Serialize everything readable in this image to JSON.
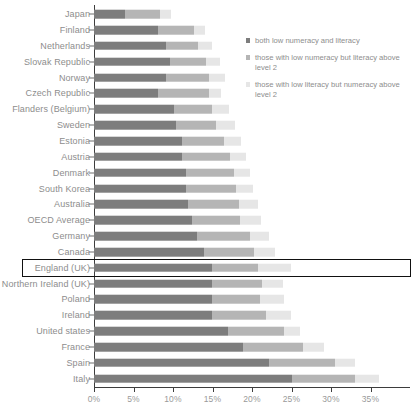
{
  "chart_data": {
    "type": "bar",
    "orientation": "horizontal",
    "stacked": true,
    "title": "",
    "xlabel": "",
    "ylabel": "",
    "xlim": [
      0,
      40
    ],
    "xticks": [
      "0%",
      "5%",
      "10%",
      "15%",
      "20%",
      "25%",
      "30%",
      "35%"
    ],
    "xtick_values": [
      0,
      5,
      10,
      15,
      20,
      25,
      30,
      35
    ],
    "grid": false,
    "legend_position": "top-right",
    "series": [
      {
        "name": "both low numeracy and literacy",
        "color": "#7d7d7d",
        "values": [
          3.9,
          8.1,
          9.1,
          9.6,
          9.1,
          8.1,
          10.1,
          10.4,
          11.1,
          11.1,
          11.6,
          11.6,
          11.9,
          12.4,
          13.1,
          13.9,
          14.9,
          14.9,
          14.9,
          14.9,
          16.9,
          18.9,
          22.1,
          25.1
        ]
      },
      {
        "name": "those with low numeracy but literacy above level 2",
        "color": "#b5b5b5",
        "values": [
          4.4,
          4.6,
          4.1,
          4.6,
          5.4,
          6.4,
          4.9,
          5.1,
          5.4,
          6.1,
          6.1,
          6.4,
          6.4,
          6.1,
          6.6,
          6.4,
          5.9,
          6.4,
          6.1,
          6.9,
          7.1,
          7.6,
          8.4,
          7.9
        ]
      },
      {
        "name": "those with low literacy but numeracy above level 2",
        "color": "#e6e6e6",
        "values": [
          1.5,
          1.4,
          1.8,
          1.8,
          2.1,
          1.6,
          2.1,
          2.4,
          2.1,
          2.0,
          2.1,
          2.1,
          2.4,
          2.6,
          2.4,
          2.6,
          4.1,
          2.6,
          3.1,
          3.1,
          2.1,
          2.6,
          2.6,
          3.1
        ]
      }
    ],
    "categories": [
      "Japan",
      "Finland",
      "Netherlands",
      "Slovak Republic",
      "Norway",
      "Czech Republic",
      "Flanders (Belgium)",
      "Sweden",
      "Estonia",
      "Austria",
      "Denmark",
      "South Korea",
      "Australia",
      "OECD Average",
      "Germany",
      "Canada",
      "England (UK)",
      "Northern Ireland (UK)",
      "Poland",
      "Ireland",
      "United states",
      "France",
      "Spain",
      "Italy"
    ],
    "highlighted_category": "England (UK)",
    "legend": [
      "both low numeracy and literacy",
      "those with low numeracy but literacy above level 2",
      "those with low literacy but numeracy above level 2"
    ],
    "colors": {
      "segment_both": "#7d7d7d",
      "segment_numeracy": "#b5b5b5",
      "segment_literacy": "#e6e6e6",
      "axis": "#3d3d3d",
      "label_text": "#8d8d8d",
      "highlight_outline": "#111111"
    }
  }
}
